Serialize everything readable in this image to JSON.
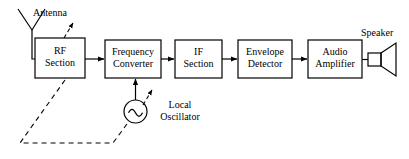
{
  "figure": {
    "type": "block-diagram",
    "background_color": "#ffffff",
    "stroke_color": "#000000",
    "text_color": "#000000"
  },
  "blocks": [
    {
      "id": "rf-section",
      "label": "RF\nSection",
      "x": 35,
      "y": 38,
      "w": 50,
      "h": 40
    },
    {
      "id": "frequency-converter",
      "label": "Frequency\nConverter",
      "x": 105,
      "y": 40,
      "w": 56,
      "h": 38
    },
    {
      "id": "if-section",
      "label": "IF\nSection",
      "x": 175,
      "y": 40,
      "w": 47,
      "h": 38
    },
    {
      "id": "envelope-detector",
      "label": "Envelope\nDetector",
      "x": 238,
      "y": 40,
      "w": 54,
      "h": 38
    },
    {
      "id": "audio-amplifier",
      "label": "Audio\nAmplifier",
      "x": 308,
      "y": 40,
      "w": 54,
      "h": 38
    }
  ],
  "labels": {
    "antenna": "Antenna",
    "speaker": "Speaker",
    "local_oscillator": "Local\nOscillator"
  },
  "components": {
    "antenna": {
      "apex_x": 32,
      "apex_y": 30,
      "left_x": 18,
      "right_x": 45,
      "top_y": 9,
      "drop_y": 59
    },
    "local_oscillator": {
      "cx": 135.5,
      "cy": 111.5,
      "r": 11.5,
      "symbol": "sine-wave"
    },
    "speaker": {
      "box_x": 368,
      "box_y": 53,
      "box_w": 13,
      "box_h": 13,
      "horn_x": 396,
      "horn_top": 43,
      "horn_bottom": 76
    }
  },
  "connectors": [
    {
      "id": "rf-to-converter",
      "from": "rf-section",
      "to": "frequency-converter",
      "arrow": true
    },
    {
      "id": "converter-to-if",
      "from": "frequency-converter",
      "to": "if-section",
      "arrow": true
    },
    {
      "id": "if-to-detector",
      "from": "if-section",
      "to": "envelope-detector",
      "arrow": true
    },
    {
      "id": "detector-to-amplifier",
      "from": "envelope-detector",
      "to": "audio-amplifier",
      "arrow": true
    },
    {
      "id": "oscillator-to-converter",
      "from": "local-oscillator",
      "to": "frequency-converter",
      "arrow": true
    },
    {
      "id": "antenna-to-rf",
      "from": "antenna",
      "to": "rf-section",
      "arrow": false
    },
    {
      "id": "amplifier-to-speaker",
      "from": "audio-amplifier",
      "to": "speaker",
      "arrow": false
    }
  ],
  "tuning": {
    "style": "dashed",
    "ganged_link_description": "dashed ganged-tuning link between RF section and local oscillator",
    "rf_arrow_label": "tuning-arrow",
    "lo_arrow_label": "tuning-arrow"
  }
}
